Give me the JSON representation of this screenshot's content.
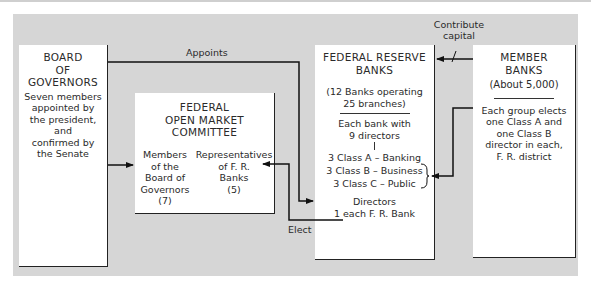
{
  "board": {
    "title_lines": [
      "BOARD",
      "OF",
      "GOVERNORS"
    ],
    "desc_lines": [
      "Seven members",
      "appointed by",
      "the president,",
      "and",
      "confirmed by",
      "the Senate"
    ]
  },
  "fomc": {
    "title_lines": [
      "FEDERAL",
      "OPEN MARKET",
      "COMMITTEE"
    ],
    "members_lines": [
      "Members",
      "of the",
      "Board of",
      "Governors",
      "(7)"
    ],
    "reps_lines": [
      "Representatives",
      "of F. R.",
      "Banks",
      "(5)"
    ]
  },
  "frb": {
    "title_lines": [
      "FEDERAL RESERVE",
      "BANKS"
    ],
    "count_lines": [
      "(12 Banks operating",
      "25 branches)"
    ],
    "directors_lines": [
      "Each bank with",
      "9 directors"
    ],
    "classes": [
      "3 Class A – Banking",
      "3 Class B – Business",
      "3 Class C – Public"
    ],
    "directors_note_lines": [
      "Directors",
      "1 each F. R. Bank"
    ]
  },
  "member": {
    "title_lines": [
      "MEMBER",
      "BANKS"
    ],
    "count": "(About 5,000)",
    "desc_lines": [
      "Each group elects",
      "one Class A and",
      "one Class B",
      "director in each,",
      "F. R. district"
    ]
  },
  "labels": {
    "appoints": "Appoints",
    "contribute_lines": [
      "Contribute",
      "capital"
    ],
    "elect": "Elect"
  },
  "colors": {
    "panel": "#d6d6d6",
    "box": "#ffffff",
    "line": "#222222"
  }
}
